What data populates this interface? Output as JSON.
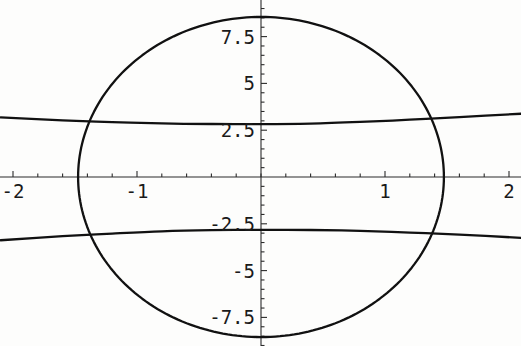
{
  "figure": {
    "kind": "implicit-contour-plot",
    "background_color": "#fdfdfc",
    "curve_color": "#111111",
    "axis_color": "#2b2b2b",
    "label_color": "#1a1a1a",
    "width": 521,
    "height": 346
  },
  "chart_data": {
    "type": "line",
    "title": "",
    "subtitle": "",
    "xlabel": "",
    "ylabel": "",
    "xlim": [
      -2.1,
      2.1
    ],
    "ylim": [
      -9.0,
      9.0
    ],
    "grid": false,
    "legend": null,
    "legend_position": "none",
    "axes": {
      "style": "crossed-at-origin",
      "origin": [
        0,
        0
      ],
      "x_ticks_major": [
        -2,
        -1,
        1,
        2
      ],
      "x_tick_labels": [
        "-2",
        "-1",
        "1",
        "2"
      ],
      "x_ticks_minor_step": 0.2,
      "y_ticks_major": [
        -7.5,
        -5,
        -2.5,
        2.5,
        5,
        7.5
      ],
      "y_tick_labels": [
        "-7.5",
        "-5",
        "-2.5",
        "2.5",
        "5",
        "7.5"
      ],
      "y_ticks_minor_step": 0.5,
      "x_units_per_major": 1,
      "y_units_per_major": 2.5
    },
    "series": [
      {
        "name": "closed-oval-curve",
        "shape": "ellipse",
        "closed": true,
        "center": [
          0,
          0
        ],
        "x_semi_axis": 1.475,
        "y_semi_axis": 8.55,
        "x_extent": [
          -1.475,
          1.475
        ],
        "y_extent": [
          -8.55,
          8.55
        ]
      },
      {
        "name": "upper-branch-curve",
        "shape": "shallow-arc",
        "closed": false,
        "x": [
          -2.1,
          -1.6,
          -1.2,
          -0.8,
          -0.4,
          0.0,
          0.4,
          0.8,
          1.2,
          1.6,
          2.1
        ],
        "y": [
          3.18,
          3.03,
          2.93,
          2.86,
          2.83,
          2.82,
          2.85,
          2.94,
          3.06,
          3.2,
          3.38
        ]
      },
      {
        "name": "lower-branch-curve",
        "shape": "shallow-arc",
        "closed": false,
        "x": [
          -2.1,
          -1.6,
          -1.2,
          -0.8,
          -0.4,
          0.0,
          0.4,
          0.8,
          1.2,
          1.6,
          2.1
        ],
        "y": [
          -3.38,
          -3.16,
          -3.02,
          -2.9,
          -2.84,
          -2.82,
          -2.83,
          -2.88,
          -2.97,
          -3.08,
          -3.25
        ]
      }
    ],
    "annotations": []
  }
}
